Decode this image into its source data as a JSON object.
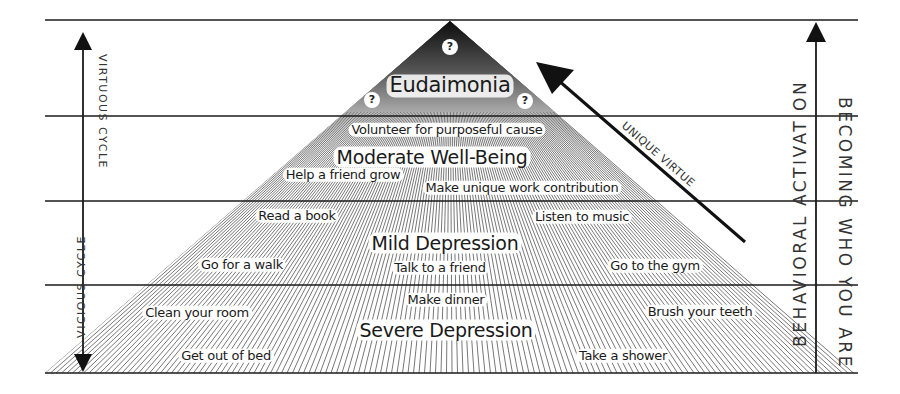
{
  "levels": {
    "eudaimonia": {
      "title": "Eudaimonia",
      "unknowns": [
        "?",
        "?",
        "?"
      ]
    },
    "moderate_well_being": {
      "title": "Moderate Well-Being",
      "activities": [
        "Volunteer for purposeful cause",
        "Help a friend grow",
        "Make unique work contribution"
      ]
    },
    "mild_depression": {
      "title": "Mild Depression",
      "activities": [
        "Read a book",
        "Listen to music",
        "Go for a walk",
        "Talk to a friend",
        "Go to the gym"
      ]
    },
    "severe_depression": {
      "title": "Severe Depression",
      "activities": [
        "Make dinner",
        "Clean your room",
        "Brush your teeth",
        "Get out of bed",
        "Take a shower"
      ]
    }
  },
  "left_axis": {
    "upper_label": "VIRTUOUS CYCLE",
    "lower_label": "VICIOUS CYCLE"
  },
  "right_axis": {
    "inner_label": "BEHAVIORAL ACTIVAT ON",
    "outer_label": "BECOMING WHO YOU ARE"
  },
  "diagonal_arrow": {
    "label": "UNIQUE VIRTUE"
  },
  "colors": {
    "line": "#1a1a1a",
    "hatch": "#555555",
    "apex_dark": "#111111",
    "background": "#ffffff"
  }
}
